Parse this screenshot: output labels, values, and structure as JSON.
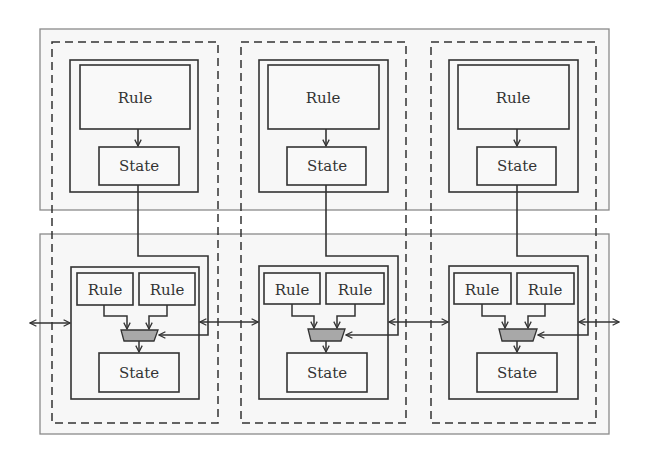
{
  "diagram": {
    "type": "block-diagram",
    "colors": {
      "background": "#ffffff",
      "region_fill": "#f7f7f7",
      "region_stroke": "#8a8a8a",
      "line": "#333333",
      "mux_fill": "#a8a8a8",
      "dashed": "#333333"
    },
    "top_layer": {
      "columns": [
        {
          "rule_label": "Rule",
          "state_label": "State"
        },
        {
          "rule_label": "Rule",
          "state_label": "State"
        },
        {
          "rule_label": "Rule",
          "state_label": "State"
        }
      ]
    },
    "bottom_layer": {
      "columns": [
        {
          "rule_left_label": "Rule",
          "rule_right_label": "Rule",
          "state_label": "State"
        },
        {
          "rule_left_label": "Rule",
          "rule_right_label": "Rule",
          "state_label": "State"
        },
        {
          "rule_left_label": "Rule",
          "rule_right_label": "Rule",
          "state_label": "State"
        }
      ]
    }
  }
}
